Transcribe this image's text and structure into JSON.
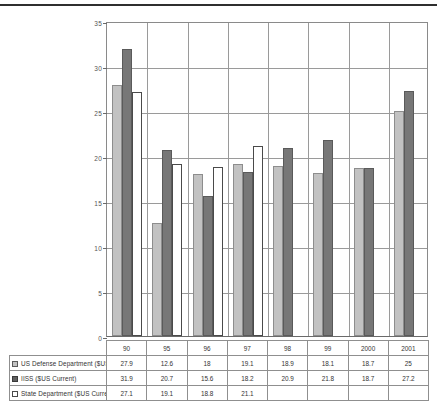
{
  "chart_data": {
    "type": "bar",
    "title": "",
    "subtitle": "",
    "xlabel": "",
    "ylabel": "",
    "ylim": [
      0,
      35
    ],
    "ytick_step": 5,
    "yticks": [
      "0",
      "5",
      "10",
      "15",
      "20",
      "25",
      "30",
      "35"
    ],
    "grid": true,
    "legend_position": "data-table",
    "categories": [
      "90",
      "95",
      "96",
      "97",
      "98",
      "99",
      "2000",
      "2001"
    ],
    "series": [
      {
        "name": "US Defense Department ($US 2000)",
        "swatch": "light-gray",
        "color": "#C2C2C2",
        "values": [
          27.9,
          12.6,
          18,
          19.1,
          18.9,
          18.1,
          18.7,
          25
        ],
        "value_labels": [
          "27.9",
          "12.6",
          "18",
          "19.1",
          "18.9",
          "18.1",
          "18.7",
          "25"
        ]
      },
      {
        "name": "IISS ($US Current)",
        "swatch": "dark-gray",
        "color": "#777777",
        "values": [
          31.9,
          20.7,
          15.6,
          18.2,
          20.9,
          21.8,
          18.7,
          27.2
        ],
        "value_labels": [
          "31.9",
          "20.7",
          "15.6",
          "18.2",
          "20.9",
          "21.8",
          "18.7",
          "27.2"
        ]
      },
      {
        "name": "State Department ($US Current)",
        "swatch": "white",
        "color": "#FFFFFF",
        "values": [
          27.1,
          19.1,
          18.8,
          21.1,
          null,
          null,
          null,
          null
        ],
        "value_labels": [
          "27.1",
          "19.1",
          "18.8",
          "21.1",
          "",
          "",
          "",
          ""
        ]
      }
    ]
  }
}
